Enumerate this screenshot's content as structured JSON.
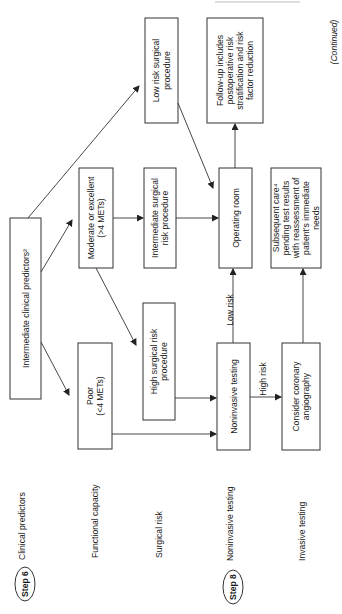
{
  "header_partial": "(continued)",
  "continued_label": "(Continued)",
  "steps": [
    {
      "badge": "Step 6",
      "label": "Clinical predictors"
    },
    {
      "badge": "Step 8",
      "label": "Noninvasive testing"
    }
  ],
  "row_labels": {
    "functional_capacity": "Functional capacity",
    "surgical_risk": "Surgical risk",
    "invasive_testing": "Invasive testing"
  },
  "nodes": {
    "intermediate_predictors": [
      "Intermediate clinical predictors²"
    ],
    "moderate_excellent": [
      "Moderate or excellent",
      "(>4 METs)"
    ],
    "poor": [
      "Poor",
      "(<4 METs)"
    ],
    "low_risk_surgical": [
      "Low risk surgical",
      "procedure"
    ],
    "intermediate_surgical": [
      "Intermediate surgical",
      "risk procedure"
    ],
    "high_surgical": [
      "High surgical risk",
      "procedure"
    ],
    "operating_room": [
      "Operating room"
    ],
    "noninvasive_testing": [
      "Noninvasive testing"
    ],
    "follow_up": [
      "Follow-up includes",
      "postoperative risk",
      "stratification and risk",
      "factor reduction"
    ],
    "subsequent_care": [
      "Subsequent care⁴",
      "pending test results",
      "with reassessment of",
      "patient's immediate",
      "needs"
    ],
    "coronary_angiography": [
      "Consider coronary",
      "angiography"
    ]
  },
  "edge_labels": {
    "low_risk": "Low risk",
    "high_risk": "High risk"
  }
}
